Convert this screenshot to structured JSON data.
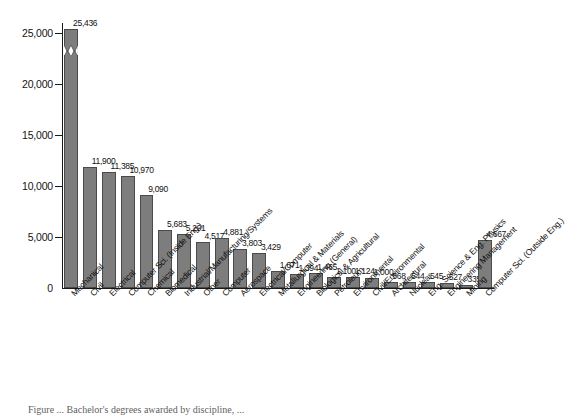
{
  "figure": {
    "caption_partial": "Figure ... Bachelor's degrees awarded by discipline, ...",
    "bar_color": "#7d7d7d",
    "bar_edge_color": "#4a4a4a",
    "axis_color": "#1a1a1a"
  },
  "axis": {
    "y_ticks": [
      "0",
      "5,000",
      "10,000",
      "15,000",
      "20,000",
      "25,000"
    ],
    "zero_label": "0"
  },
  "chart_data": {
    "type": "bar",
    "title": "",
    "xlabel": "",
    "ylabel": "",
    "ylim": [
      0,
      26000
    ],
    "grid": false,
    "legend": "none",
    "axis_break": {
      "present": true,
      "series_index": 0,
      "note": "zigzag break drawn near top of tallest bar"
    },
    "categories": [
      "Mechanical",
      "Civil",
      "Electrical",
      "Computer Sci. (Inside Eng.)",
      "Chemical",
      "Biomedical",
      "Industrial/Manufacturing/Systems",
      "Other",
      "Computer",
      "Aerospace",
      "Electrical/Computer",
      "Metallurgical & Materials",
      "Engineering (General)",
      "Biological & Agricultural",
      "Petroleum",
      "Environmental",
      "Civil/Environmental",
      "Architectural",
      "Nuclear",
      "Eng. Science & Eng. Physics",
      "Engineering Management",
      "Mining",
      "Computer Sci. (Outside Eng.)"
    ],
    "values": [
      25436,
      11900,
      11385,
      10970,
      9090,
      5683,
      5291,
      4517,
      4881,
      3803,
      3429,
      1671,
      1394,
      1465,
      1100,
      1124,
      1000,
      568,
      544,
      545,
      527,
      335,
      4667
    ],
    "value_labels": [
      "25,436",
      "11,900",
      "11,385",
      "10,970",
      "9,090",
      "5,683",
      "5,291",
      "4,517",
      "4,881",
      "3,803",
      "3,429",
      "1,671",
      "1,394",
      "1,465",
      "1,100",
      "1,124",
      "1,000",
      "568",
      "544",
      "545",
      "527",
      "335",
      "4,667"
    ]
  }
}
